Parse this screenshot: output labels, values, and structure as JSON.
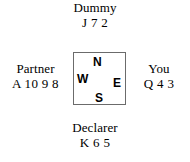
{
  "diagram": {
    "type": "bridge-compass-hand-diagram",
    "border_color": "#6b6b6b",
    "text_color": "#000000",
    "background_color": "#ffffff"
  },
  "compass": {
    "north_label": "N",
    "west_label": "W",
    "east_label": "E",
    "south_label": "S"
  },
  "seats": {
    "north": {
      "name": "Dummy",
      "cards": "J 7 2"
    },
    "west": {
      "name": "Partner",
      "cards": "A 10 9 8"
    },
    "east": {
      "name": "You",
      "cards": "Q 4 3"
    },
    "south": {
      "name": "Declarer",
      "cards": "K 6 5"
    }
  }
}
